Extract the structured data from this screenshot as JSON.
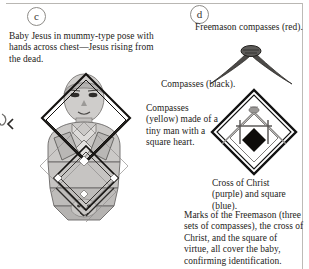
{
  "plate": {
    "panels": [
      {
        "id": "c",
        "label": "c"
      },
      {
        "id": "d",
        "label": "d"
      }
    ]
  },
  "captions": {
    "baby_jesus": "Baby Jesus in mummy-type pose with hands across chest—Jesus  rising from the dead.",
    "freemason_compasses_red": "Freemason compasses (red).",
    "compasses_black": "Compasses (black).",
    "compasses_yellow": "Compasses (yellow) made of a tiny man with a square heart.",
    "cross_of_christ": "Cross of Christ (purple) and square (blue).",
    "marks_summary": "Marks of the Freemason (three sets of compasses), the cross of Christ, and the square of virtue, all cover the baby,  confirming identification."
  },
  "figures": {
    "baby_figure": {
      "name": "baby-jesus-mummy-figure",
      "description": "Shaded grey swaddled infant figure with overlaid black diamond outlines"
    },
    "red_compasses": {
      "name": "freemason-compasses-red",
      "description": "Dark inverted-V compasses with hinge node at apex"
    },
    "diamond_emblem": {
      "name": "compasses-cross-square-emblem",
      "description": "Large black diamond containing grey compasses, a tiny man, and a solid black diamond heart"
    },
    "left_edge_mark": {
      "name": "partial-edge-mark",
      "description": "Partial chevron and curl cropped at the left margin"
    }
  },
  "colors": {
    "ink": "#242220",
    "rule": "#b9b7b3",
    "figure_fill_light": "#d6d4d2",
    "figure_fill_mid": "#bfbdbb",
    "figure_fill_dark": "#a6a4a2",
    "outline": "#4b4947",
    "black": "#111111"
  }
}
